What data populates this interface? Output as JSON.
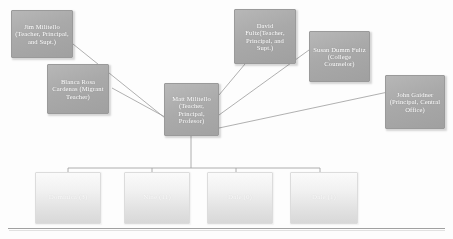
{
  "diagram": {
    "type": "organizational-chart",
    "title": "",
    "hub": {
      "id": "matt-militello",
      "label": "Matt Militello (Teacher, Principal, Profesor)",
      "role": "center"
    },
    "peers": [
      {
        "id": "jim-militello",
        "label": "Jim Militello (Teacher, Principal, and Supt.)",
        "position": "top-left"
      },
      {
        "id": "blanca-rosa-cardenas",
        "label": "Blanca Rosa Cardenas (Migrant Teacher)",
        "position": "left"
      },
      {
        "id": "david-fultz",
        "label": "David Fultz(Teacher, Principal, and Supt.)",
        "position": "top-center-right"
      },
      {
        "id": "susan-dumm-fultz",
        "label": "Susan Dumm Fultz (College Counselor)",
        "position": "top-right"
      },
      {
        "id": "john-gaidner",
        "label": "John Gaidner (Principal, Central Office)",
        "position": "right"
      }
    ],
    "children": [
      {
        "id": "child-1",
        "label": "Dominica (3)"
      },
      {
        "id": "child-2",
        "label": "Nine (11)"
      },
      {
        "id": "child-3",
        "label": "Dale (0)"
      },
      {
        "id": "child-4",
        "label": "Dale (1)"
      }
    ],
    "colors": {
      "node_fill": "#ababab",
      "node_text": "#ffffff",
      "node_border": "#9a9a9a",
      "faded_node_fill": "#e6e6e6",
      "connector": "#8c8c8c",
      "background": "#fdfdfd",
      "divider": "#8f8f8f"
    }
  }
}
